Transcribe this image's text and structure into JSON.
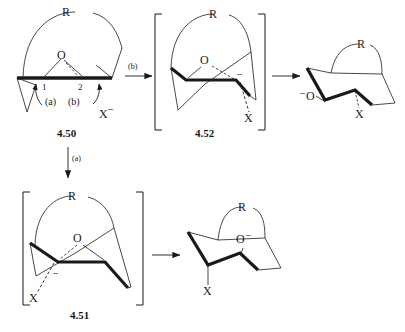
{
  "figure": {
    "type": "reaction-mechanism-diagram",
    "ink_color": "#1a1a1a",
    "background_color": "#ffffff"
  },
  "structures": {
    "start": {
      "id": "4.50",
      "label": "4.50",
      "conformation": "planar",
      "atoms": {
        "oxygen": "O",
        "r_group": "R"
      },
      "positions": {
        "c1": "1",
        "c2": "2"
      },
      "pathway_a": "(a)",
      "pathway_b": "(b)",
      "nucleophile": "X",
      "nucleophile_charge": "–"
    },
    "intermediate_b": {
      "id": "4.52",
      "label": "4.52",
      "conformation": "half-chair",
      "bracketed": true,
      "atoms": {
        "oxygen": "O",
        "r_group": "R",
        "leaving": "X"
      },
      "charge": "–"
    },
    "product_b": {
      "id": "product-top-right",
      "conformation": "chair",
      "atoms": {
        "alkoxide": "O",
        "r_group": "R",
        "substituent": "X"
      },
      "alkoxide_charge": "–"
    },
    "intermediate_a": {
      "id": "4.51",
      "label": "4.51",
      "conformation": "half-chair",
      "bracketed": true,
      "atoms": {
        "oxygen": "O",
        "r_group": "R",
        "leaving": "X"
      },
      "charge": "–"
    },
    "product_a": {
      "id": "product-bottom-right",
      "conformation": "chair",
      "atoms": {
        "alkoxide": "O",
        "r_group": "R",
        "substituent": "X"
      },
      "alkoxide_charge": "–"
    }
  },
  "arrows": {
    "horizontal_top": {
      "label": "(b)",
      "direction": "right"
    },
    "vertical_left": {
      "label": "(a)",
      "direction": "down"
    },
    "top_right": {
      "label": "",
      "direction": "right"
    },
    "bottom_right": {
      "label": "",
      "direction": "right"
    }
  }
}
